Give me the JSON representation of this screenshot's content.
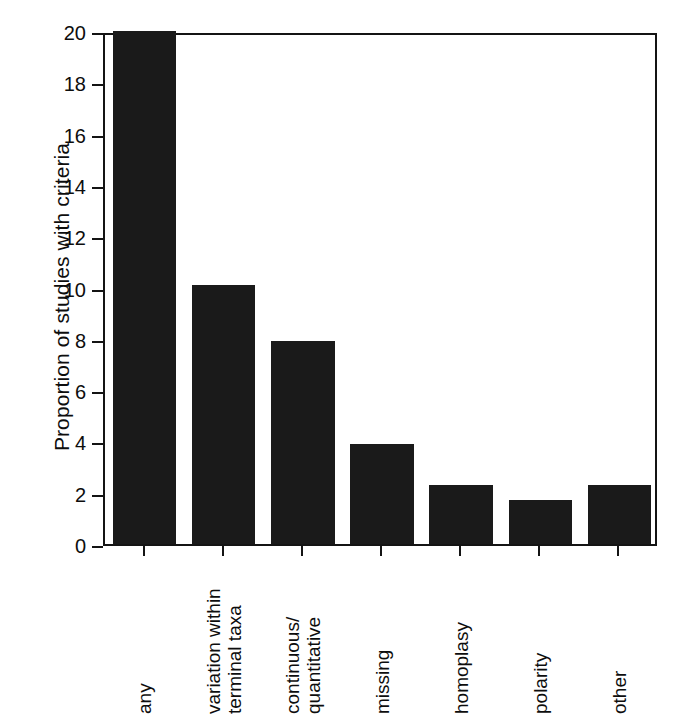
{
  "chart_data": {
    "type": "bar",
    "title": "",
    "xlabel": "",
    "ylabel": "Proportion of studies with criteria",
    "categories": [
      "any",
      "variation within\nterminal taxa",
      "continuous/\nquantitative",
      "missing",
      "homoplasy",
      "polarity",
      "other"
    ],
    "values": [
      20.0,
      10.1,
      7.9,
      3.9,
      2.3,
      1.7,
      2.3
    ],
    "ylim": [
      0,
      20
    ],
    "yticks": [
      0,
      2,
      4,
      6,
      8,
      10,
      12,
      14,
      16,
      18,
      20
    ],
    "ytick_labels": [
      "0",
      "2",
      "4",
      "6",
      "8",
      "10",
      "12",
      "14",
      "16",
      "18",
      "20"
    ],
    "grid": false,
    "legend": null,
    "bar_color": "#1a1a1a",
    "axis_color": "#141414",
    "background": "#ffffff",
    "xtick_label_rotation": 90
  },
  "caption": {
    "text": ""
  }
}
